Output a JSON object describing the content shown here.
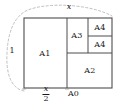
{
  "figure": {
    "type": "geometry-diagram",
    "width": 120,
    "height": 110,
    "stroke_color": "#4d4d4d",
    "text_color": "#1a1a1a",
    "background": "#ffffff",
    "arc": {
      "style": "dashed",
      "color": "#b3b3b3",
      "description": "quarter circle of radius 1 centered at bottom-right corner A0"
    },
    "outer_rect": {
      "x": 24,
      "y": 18,
      "width": 88,
      "height": 70
    },
    "regions": [
      {
        "id": "A1",
        "label": "A1",
        "x": 24,
        "y": 18,
        "width": 43,
        "height": 70,
        "cx": 45,
        "cy": 53
      },
      {
        "id": "A2",
        "label": "A2",
        "x": 67,
        "y": 53,
        "width": 45,
        "height": 35,
        "cx": 90,
        "cy": 70
      },
      {
        "id": "A3",
        "label": "A3",
        "x": 67,
        "y": 18,
        "width": 21,
        "height": 35,
        "cx": 77,
        "cy": 35
      },
      {
        "id": "A4a",
        "label": "A4",
        "x": 88,
        "y": 18,
        "width": 24,
        "height": 18,
        "cx": 100,
        "cy": 27
      },
      {
        "id": "A4b",
        "label": "A4",
        "x": 88,
        "y": 36,
        "width": 24,
        "height": 17,
        "cx": 100,
        "cy": 44
      }
    ],
    "dimensions": [
      {
        "id": "top-width",
        "label": "x",
        "italic": true,
        "x": 69,
        "y": 6
      },
      {
        "id": "left-height",
        "label": "1",
        "italic": false,
        "x": 12,
        "y": 50
      },
      {
        "id": "bottom-half-width",
        "numerator": "x",
        "denominator": "2",
        "x": 46,
        "y": 94
      }
    ],
    "points": [
      {
        "id": "A0",
        "label": "A0",
        "x": 68,
        "y": 91
      }
    ]
  }
}
